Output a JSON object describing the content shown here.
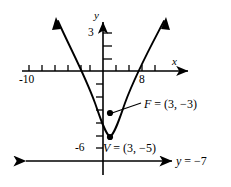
{
  "figure": {
    "type": "parabola-graph",
    "axis_labels": {
      "x_axis_name": "x",
      "y_axis_name": "y"
    },
    "tick_labels": {
      "x_neg10": "-10",
      "x_8": "8",
      "y_3": "3",
      "y_neg6": "-6"
    },
    "annotations": {
      "focus": "F = (3, −3)",
      "vertex": "V = (3, −5)",
      "directrix": "y = −7"
    },
    "colors": {
      "stroke": "#000000",
      "background": "#ffffff"
    }
  },
  "chart_data": {
    "type": "line",
    "title": "",
    "xlabel": "x",
    "ylabel": "y",
    "xlim": [
      -13,
      12
    ],
    "ylim": [
      -8,
      4.5
    ],
    "grid": false,
    "legend": null,
    "curve": {
      "name": "parabola",
      "equation": "(x - 3)^2 = 8(y + 5)",
      "vertex": [
        3,
        -5
      ],
      "focus": [
        3,
        -3
      ],
      "directrix_y": -7,
      "focal_parameter_p": 2,
      "opens": "up",
      "x": [
        -5.5,
        -4,
        -2,
        0,
        1,
        2,
        3,
        4,
        5,
        6,
        7,
        8,
        9,
        10,
        11.5
      ],
      "y": [
        4.6,
        1.1,
        -1.9,
        -3.9,
        -4.5,
        -4.875,
        -5,
        -4.875,
        -4.5,
        -3.875,
        -3,
        -1.875,
        -0.5,
        1.125,
        4.2
      ]
    },
    "points": [
      {
        "label": "F = (3, −3)",
        "x": 3,
        "y": -3,
        "name": "focus"
      },
      {
        "label": "V = (3, −5)",
        "x": 3,
        "y": -5,
        "name": "vertex"
      }
    ],
    "lines": [
      {
        "label": "y = −7",
        "type": "horizontal",
        "value": -7,
        "name": "directrix",
        "arrows": "both"
      }
    ],
    "x_ticks": [
      -12,
      -10,
      -8,
      -6,
      -4,
      -2,
      2,
      4,
      6,
      8,
      10
    ],
    "x_tick_labels_shown": [
      -10,
      8
    ],
    "y_ticks": [
      3,
      2,
      1,
      -1,
      -2,
      -3,
      -4,
      -5,
      -6
    ],
    "y_tick_labels_shown": [
      3,
      -6
    ]
  }
}
